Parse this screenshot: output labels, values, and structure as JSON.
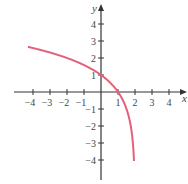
{
  "chart_data": {
    "type": "line",
    "title": "",
    "xlabel": "x",
    "ylabel": "y",
    "xlim": [
      -4.5,
      4.9
    ],
    "ylim": [
      -4.6,
      5.1
    ],
    "x_ticks": [
      -4,
      -3,
      -2,
      -1,
      1,
      2,
      3,
      4
    ],
    "y_ticks": [
      -4,
      -3,
      -2,
      -1,
      1,
      2,
      3,
      4
    ],
    "x_tick_labels": [
      "-4",
      "-3",
      "-2",
      "-1",
      "1",
      "2",
      "3",
      "4"
    ],
    "y_tick_labels": [
      "-4",
      "-3",
      "-2",
      "-1",
      "1",
      "2",
      "3",
      "4"
    ],
    "grid": false,
    "function": "y = log2(2 - x)",
    "vertical_asymptote": 2,
    "series": [
      {
        "name": "curve",
        "color": "#e5607a",
        "x": [
          -4.3,
          -4,
          -3,
          -2,
          -1,
          0,
          0.5,
          1,
          1.5,
          1.75,
          1.9,
          1.95
        ],
        "y": [
          2.0,
          1.92,
          1.7,
          1.5,
          1.25,
          1.0,
          0.7,
          0,
          -1.0,
          -2.0,
          -3.3,
          -4.3
        ]
      }
    ]
  },
  "axis": {
    "x_label": "x",
    "y_label": "y"
  }
}
